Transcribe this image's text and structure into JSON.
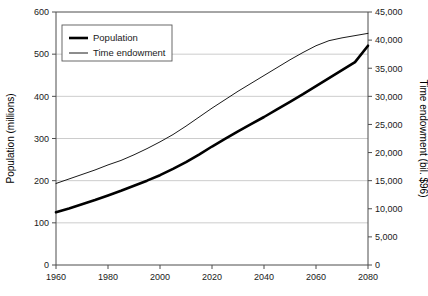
{
  "chart_data": {
    "type": "line",
    "title": "",
    "xlabel": "",
    "ylabel": "Population (millions)",
    "y2label": "Time endowment (bil. $96)",
    "grid": true,
    "legend_position": "top-left",
    "xlim": [
      1960,
      2080
    ],
    "ylim": [
      0,
      600
    ],
    "y2lim": [
      0,
      45000
    ],
    "x_ticks": [
      1960,
      1980,
      2000,
      2020,
      2040,
      2060,
      2080
    ],
    "x_tick_labels": [
      "1960",
      "1980",
      "2000",
      "2020",
      "2040",
      "2060",
      "2080"
    ],
    "y_ticks": [
      0,
      100,
      200,
      300,
      400,
      500,
      600
    ],
    "y_tick_labels": [
      "0",
      "100",
      "200",
      "300",
      "400",
      "500",
      "600"
    ],
    "y2_ticks": [
      0,
      5000,
      10000,
      15000,
      20000,
      25000,
      30000,
      35000,
      40000,
      45000
    ],
    "y2_tick_labels": [
      "0",
      "5,000",
      "10,000",
      "15,000",
      "20,000",
      "25,000",
      "30,000",
      "35,000",
      "40,000",
      "45,000"
    ],
    "x": [
      1960,
      1965,
      1970,
      1975,
      1980,
      1985,
      1990,
      1995,
      2000,
      2005,
      2010,
      2015,
      2020,
      2025,
      2030,
      2035,
      2040,
      2045,
      2050,
      2055,
      2060,
      2065,
      2070,
      2075,
      2080
    ],
    "series": [
      {
        "name": "Population",
        "axis": "left",
        "units": "millions",
        "line_width": 2.6,
        "color": "#000000",
        "values": [
          125,
          134,
          144,
          154,
          165,
          176,
          188,
          200,
          213,
          228,
          244,
          262,
          281,
          299,
          317,
          334,
          351,
          369,
          387,
          405,
          424,
          443,
          462,
          481,
          520
        ]
      },
      {
        "name": "Time endowment",
        "axis": "right",
        "units": "bil. $96",
        "line_width": 0.9,
        "color": "#000000",
        "values": [
          14500,
          15300,
          16100,
          16900,
          17800,
          18600,
          19600,
          20700,
          21900,
          23200,
          24700,
          26300,
          27900,
          29400,
          30900,
          32300,
          33700,
          35100,
          36500,
          37800,
          39000,
          39900,
          40400,
          40800,
          41200
        ]
      }
    ],
    "legend_entries": [
      {
        "label": "Population",
        "style": "thick"
      },
      {
        "label": "Time endowment",
        "style": "thin"
      }
    ]
  },
  "colors": {
    "line": "#000000",
    "grid": "#bfbfbf",
    "axis": "#4d4d4d",
    "background": "#ffffff"
  }
}
